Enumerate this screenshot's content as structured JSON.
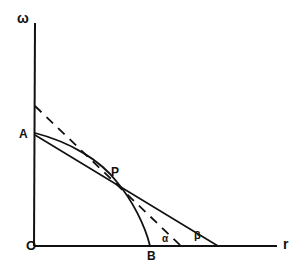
{
  "diagram": {
    "axes": {
      "y_label": "ω",
      "x_label": "r",
      "origin_label": "O"
    },
    "points": {
      "A": "A",
      "P": "P",
      "B": "B"
    },
    "angles": {
      "alpha": "α",
      "beta": "β"
    },
    "colors": {
      "ink": "#111111",
      "background": "#ffffff"
    }
  }
}
